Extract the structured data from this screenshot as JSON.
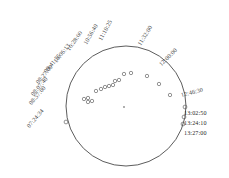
{
  "figure": {
    "caption": "",
    "colors": {
      "disk_outline": "#4a4a4a",
      "marker": "#5a5a5a",
      "label_text": "#1f1f1f",
      "background": "#ffffff",
      "center_marker": "#8a8a8a"
    },
    "disk": {
      "center_x": 126,
      "center_y": 106,
      "radius": 60
    }
  },
  "timestamps": [
    {
      "label": "07:24:34",
      "angle_deg": 183,
      "label_rot": -50,
      "lx": 28,
      "ly": 124
    },
    {
      "label": "08:57:00",
      "angle_deg": 168,
      "label_rot": -50,
      "lx": 30,
      "ly": 101
    },
    {
      "label": "08:07:40",
      "angle_deg": 162,
      "label_rot": -50,
      "lx": 32,
      "ly": 92
    },
    {
      "label": "08:27:00",
      "angle_deg": 155,
      "label_rot": -50,
      "lx": 37,
      "ly": 80
    },
    {
      "label": "09:41:55",
      "angle_deg": 143,
      "label_rot": -50,
      "lx": 45,
      "ly": 69
    },
    {
      "label": "10:06:13",
      "angle_deg": 133,
      "label_rot": -52,
      "lx": 55,
      "ly": 59
    },
    {
      "label": "10:28:00",
      "angle_deg": 122,
      "label_rot": -55,
      "lx": 68,
      "ly": 47
    },
    {
      "label": "10:56:40",
      "angle_deg": 111,
      "label_rot": -60,
      "lx": 85,
      "ly": 41
    },
    {
      "label": "11:10:25",
      "angle_deg": 101,
      "label_rot": -62,
      "lx": 100,
      "ly": 37
    },
    {
      "label": "11:32:00",
      "angle_deg": 72,
      "label_rot": -58,
      "lx": 139,
      "ly": 42
    },
    {
      "label": "12:00:00",
      "angle_deg": 48,
      "label_rot": -45,
      "lx": 160,
      "ly": 62
    },
    {
      "label": "12:46:30",
      "angle_deg": 14,
      "label_rot": -14,
      "lx": 181,
      "ly": 92
    },
    {
      "label": "13:02:50",
      "angle_deg": 0,
      "label_rot": 0,
      "lx": 184,
      "ly": 110
    },
    {
      "label": "13:24:10",
      "angle_deg": -6,
      "label_rot": 0,
      "lx": 184,
      "ly": 120
    },
    {
      "label": "13:27:00",
      "angle_deg": -10,
      "label_rot": 0,
      "lx": 184,
      "ly": 130
    }
  ],
  "limb_markers": [
    {
      "x": 66,
      "y": 122
    },
    {
      "x": 185,
      "y": 107
    },
    {
      "x": 184,
      "y": 117
    },
    {
      "x": 183,
      "y": 124
    }
  ],
  "track_markers": [
    {
      "x": 84,
      "y": 99
    },
    {
      "x": 88,
      "y": 98
    },
    {
      "x": 88,
      "y": 102
    },
    {
      "x": 92,
      "y": 101
    },
    {
      "x": 96,
      "y": 91
    },
    {
      "x": 101,
      "y": 89
    },
    {
      "x": 105,
      "y": 87
    },
    {
      "x": 109,
      "y": 86
    },
    {
      "x": 113,
      "y": 85
    },
    {
      "x": 115,
      "y": 81
    },
    {
      "x": 119,
      "y": 80
    },
    {
      "x": 124,
      "y": 74
    },
    {
      "x": 131,
      "y": 73
    },
    {
      "x": 147,
      "y": 76
    },
    {
      "x": 159,
      "y": 84
    },
    {
      "x": 170,
      "y": 95
    }
  ],
  "center_marker": {
    "x": 124,
    "y": 107
  }
}
